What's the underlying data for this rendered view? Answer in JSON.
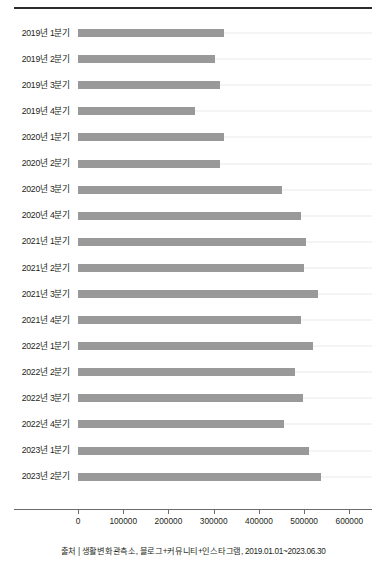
{
  "chart_data": {
    "type": "bar",
    "orientation": "horizontal",
    "title": "",
    "xlabel": "",
    "ylabel": "",
    "xlim": [
      0,
      650000
    ],
    "xticks": [
      0,
      100000,
      200000,
      300000,
      400000,
      500000,
      600000
    ],
    "xtick_labels": [
      "0",
      "100000",
      "200000",
      "300000",
      "400000",
      "500000",
      "600000"
    ],
    "grid": true,
    "grid_axis": "y",
    "legend": "none",
    "bar_color": "#999999",
    "categories": [
      "2019년 1분기",
      "2019년 2분기",
      "2019년 3분기",
      "2019년 4분기",
      "2020년 1분기",
      "2020년 2분기",
      "2020년 3분기",
      "2020년 4분기",
      "2021년 1분기",
      "2021년 2분기",
      "2021년 3분기",
      "2021년 4분기",
      "2022년 1분기",
      "2022년 2분기",
      "2022년 3분기",
      "2022년 4분기",
      "2023년 1분기",
      "2023년 2분기"
    ],
    "values": [
      322000,
      302000,
      315000,
      259000,
      322000,
      315000,
      450000,
      492000,
      503000,
      499000,
      530000,
      492000,
      519000,
      479000,
      497000,
      456000,
      510000,
      537000
    ]
  },
  "caption": {
    "text": "출처 | 생활변화관측소, 블로그+커뮤니티+인스타그램, 2019.01.01~2023.06.30"
  },
  "colors": {
    "bar": "#999999",
    "grid": "#e9e9ea",
    "axis": "#6f6b6c",
    "rule": "#2f2b2c",
    "text": "#231f20"
  }
}
